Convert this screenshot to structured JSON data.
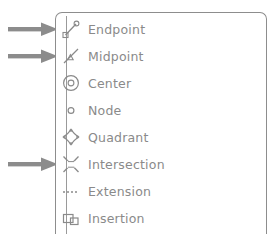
{
  "panel": {
    "name": "object-snap-modes-panel",
    "border_color": "#8d8d8d",
    "background": "#ffffff",
    "text_color": "#8a8a8a",
    "arrow_color": "#8c8c8c",
    "icon_color": "#8a8a8a",
    "rows": [
      {
        "icon": "endpoint-icon",
        "label": "Endpoint",
        "arrow": true
      },
      {
        "icon": "midpoint-icon",
        "label": "Midpoint",
        "arrow": true
      },
      {
        "icon": "center-icon",
        "label": "Center",
        "arrow": false
      },
      {
        "icon": "node-icon",
        "label": "Node",
        "arrow": false
      },
      {
        "icon": "quadrant-icon",
        "label": "Quadrant",
        "arrow": false
      },
      {
        "icon": "intersection-icon",
        "label": "Intersection",
        "arrow": true
      },
      {
        "icon": "extension-icon",
        "label": "Extension",
        "arrow": false
      },
      {
        "icon": "insertion-icon",
        "label": "Insertion",
        "arrow": false
      }
    ]
  },
  "annotations": {
    "arrow_glyph": "right-arrow",
    "arrow_count": 3,
    "arrow_targets": [
      "Endpoint",
      "Midpoint",
      "Intersection"
    ]
  }
}
